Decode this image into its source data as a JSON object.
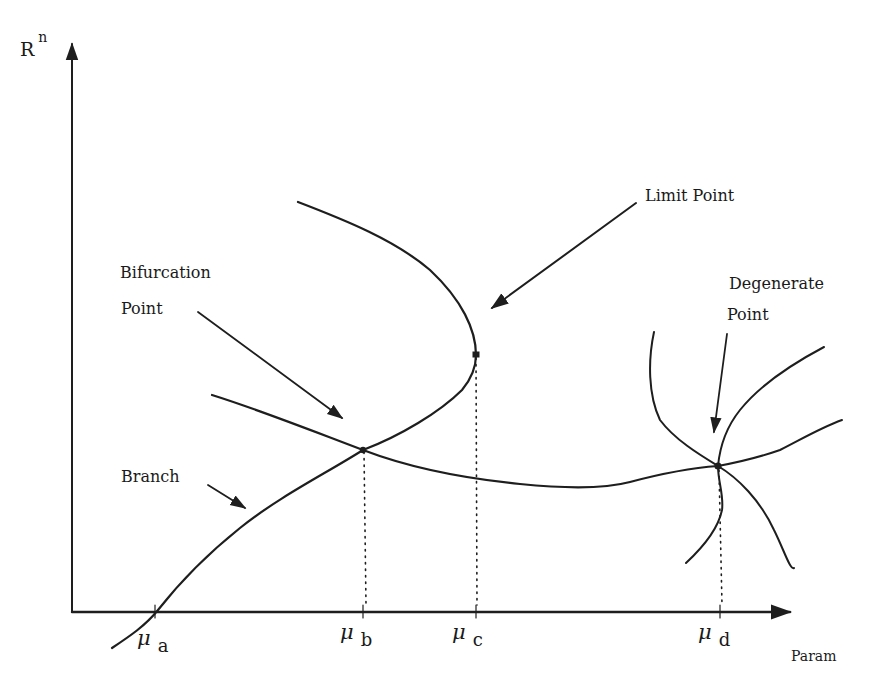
{
  "diagram": {
    "type": "bifurcation-diagram",
    "y_axis": {
      "label": "R",
      "superscript": "n"
    },
    "x_axis": {
      "label": "Param"
    },
    "parameter_ticks": [
      {
        "symbol": "μ",
        "subscript": "a"
      },
      {
        "symbol": "μ",
        "subscript": "b"
      },
      {
        "symbol": "μ",
        "subscript": "c"
      },
      {
        "symbol": "μ",
        "subscript": "d"
      }
    ],
    "annotations": {
      "limit_point": {
        "lines": [
          "Limit Point"
        ]
      },
      "bifurcation_point": {
        "lines": [
          "Bifurcation",
          "Point"
        ]
      },
      "degenerate_point": {
        "lines": [
          "Degenerate",
          "Point"
        ]
      },
      "branch": {
        "lines": [
          "Branch"
        ]
      }
    },
    "colors": {
      "ink": "#1e1e1e",
      "background": "#ffffff"
    }
  }
}
